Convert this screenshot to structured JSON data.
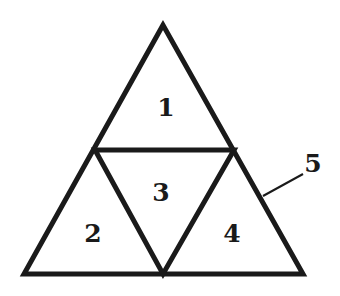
{
  "diagram": {
    "stroke_color": "#1a1a1a",
    "background": "#ffffff",
    "outer_triangle": {
      "apex": [
        163,
        25
      ],
      "left": [
        24,
        274
      ],
      "right": [
        303,
        274
      ]
    },
    "midpoints": {
      "left": [
        95,
        150
      ],
      "right": [
        234,
        150
      ],
      "bottom": [
        163,
        274
      ]
    },
    "regions": [
      {
        "id": "1",
        "label": "1",
        "x": 166,
        "y": 116
      },
      {
        "id": "2",
        "label": "2",
        "x": 93,
        "y": 242
      },
      {
        "id": "3",
        "label": "3",
        "x": 161,
        "y": 201
      },
      {
        "id": "4",
        "label": "4",
        "x": 232,
        "y": 242
      }
    ],
    "callout": {
      "label": "5",
      "x": 313,
      "y": 172,
      "line_from": [
        263,
        196
      ],
      "line_to": [
        303,
        174
      ]
    }
  }
}
